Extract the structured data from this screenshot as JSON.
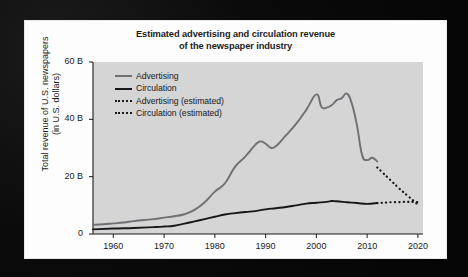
{
  "figure": {
    "title_line1": "Estimated advertising and circulation revenue",
    "title_line2": "of the newspaper industry",
    "ylabel_line1": "Total revenue of U.S. newspapers",
    "ylabel_line2": "(in U.S. dollars)",
    "plot_background": "#d5d5d5",
    "card_background": "#fdfdfd",
    "page_background": "#070707"
  },
  "legend": {
    "position": "top-left-inside",
    "items": [
      {
        "label": "Advertising",
        "style": "solid",
        "color": "#6f6f74",
        "swatch": "sw-solid-gray"
      },
      {
        "label": "Circulation",
        "style": "solid",
        "color": "#17171a",
        "swatch": "sw-solid-dark"
      },
      {
        "label": "Advertising (estimated)",
        "style": "dotted",
        "color": "#17171a",
        "swatch": "sw-dash"
      },
      {
        "label": "Circulation (estimated)",
        "style": "dotted",
        "color": "#17171a",
        "swatch": "sw-dash"
      }
    ]
  },
  "chart_data": {
    "type": "line",
    "title": "Estimated advertising and circulation revenue of the newspaper industry",
    "xlabel": "",
    "ylabel": "Total revenue of U.S. newspapers (in U.S. dollars)",
    "xlim": [
      1956,
      2021
    ],
    "ylim": [
      0,
      60
    ],
    "yticks": [
      0,
      20,
      40,
      60
    ],
    "ytick_labels": [
      "0",
      "20 B",
      "40 B",
      "60 B"
    ],
    "xticks": [
      1960,
      1970,
      1980,
      1990,
      2000,
      2010,
      2020
    ],
    "xtick_labels": [
      "1960",
      "1970",
      "1980",
      "1990",
      "2000",
      "2010",
      "2020"
    ],
    "grid": false,
    "units": "billions of U.S. dollars",
    "series": [
      {
        "name": "Advertising",
        "style": "solid",
        "color": "#6f6f74",
        "x": [
          1956,
          1958,
          1960,
          1962,
          1964,
          1966,
          1968,
          1970,
          1972,
          1974,
          1976,
          1978,
          1980,
          1982,
          1984,
          1986,
          1988,
          1989,
          1990,
          1991,
          1992,
          1994,
          1996,
          1998,
          2000,
          2001,
          2002,
          2003,
          2004,
          2005,
          2006,
          2007,
          2008,
          2009,
          2010,
          2011,
          2012
        ],
        "values": [
          3.2,
          3.4,
          3.7,
          4.0,
          4.5,
          4.9,
          5.2,
          5.7,
          6.2,
          6.9,
          8.4,
          11.1,
          14.8,
          17.7,
          23.5,
          27.0,
          31.2,
          32.3,
          31.5,
          30.1,
          30.6,
          34.4,
          38.4,
          43.3,
          48.7,
          44.3,
          44.1,
          44.9,
          46.7,
          47.4,
          49.0,
          45.4,
          37.8,
          27.6,
          25.8,
          26.6,
          25.3
        ]
      },
      {
        "name": "Circulation",
        "style": "solid",
        "color": "#17171a",
        "x": [
          1956,
          1960,
          1964,
          1968,
          1970,
          1972,
          1974,
          1976,
          1978,
          1980,
          1982,
          1984,
          1986,
          1988,
          1990,
          1992,
          1994,
          1996,
          1998,
          2000,
          2002,
          2003,
          2004,
          2006,
          2008,
          2010,
          2012
        ],
        "values": [
          1.6,
          1.9,
          2.1,
          2.4,
          2.6,
          2.9,
          3.6,
          4.4,
          5.2,
          6.0,
          6.8,
          7.3,
          7.7,
          8.0,
          8.6,
          9.0,
          9.4,
          10.0,
          10.6,
          10.9,
          11.2,
          11.5,
          11.4,
          11.1,
          10.8,
          10.5,
          10.8
        ]
      },
      {
        "name": "Advertising (estimated)",
        "style": "dotted",
        "color": "#17171a",
        "x": [
          2012,
          2013,
          2014,
          2015,
          2016,
          2017,
          2018,
          2019,
          2020
        ],
        "values": [
          23.2,
          21.5,
          19.8,
          18.1,
          16.4,
          14.8,
          13.3,
          11.8,
          10.2
        ]
      },
      {
        "name": "Circulation (estimated)",
        "style": "dotted",
        "color": "#17171a",
        "x": [
          2012,
          2013,
          2014,
          2015,
          2016,
          2017,
          2018,
          2019,
          2020
        ],
        "values": [
          10.8,
          10.9,
          11.0,
          11.1,
          11.1,
          11.2,
          11.2,
          11.2,
          11.1
        ]
      }
    ]
  }
}
